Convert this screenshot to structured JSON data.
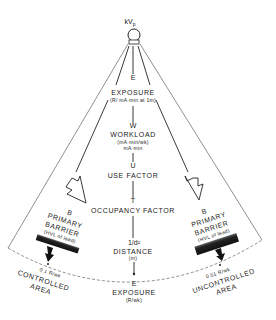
{
  "source": {
    "label": "kV",
    "subscript": "p"
  },
  "center_chain": [
    {
      "symbol": "Ė",
      "title": "EXPOSURE",
      "unit": "(R/ mA·min at 1m)"
    },
    {
      "symbol": "W",
      "title": "WORKLOAD",
      "unit": "(mA·min/wk)",
      "unit2": "mA·min"
    },
    {
      "symbol": "U",
      "title": "USE FACTOR"
    },
    {
      "symbol": "T",
      "title": "OCCUPANCY FACTOR"
    },
    {
      "symbol": "1/d²",
      "title": "DISTANCE",
      "unit": "(m)"
    },
    {
      "symbol": "E",
      "title": "EXPOSURE",
      "unit": "(R/wk)"
    }
  ],
  "left_barrier": {
    "symbol": "B",
    "line1": "PRIMARY",
    "line2": "BARRIER",
    "line3": "(HVL of lead)",
    "limit": "0.1 R/wk",
    "area_line1": "CONTROLLED",
    "area_line2": "AREA"
  },
  "right_barrier": {
    "symbol": "B",
    "line1": "PRIMARY",
    "line2": "BARRIER",
    "line3": "(HVL of lead)",
    "limit": "0.01 R/wk",
    "area_line1": "UNCONTROLLED",
    "area_line2": "AREA"
  }
}
